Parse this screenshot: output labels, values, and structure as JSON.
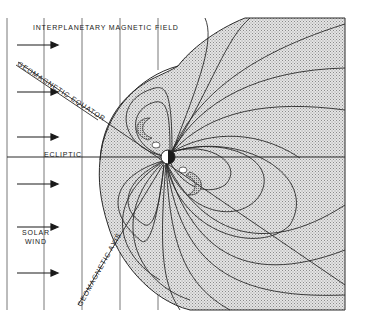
{
  "figure": {
    "labels": {
      "interplanetary_field": "INTERPLANETARY MAGNETIC FIELD",
      "geomagnetic_equator": "GEOMAGNETIC EQUATOR",
      "ecliptic": "ECLIPTIC",
      "solar_wind_line1": "SOLAR",
      "solar_wind_line2": "WIND",
      "geomagnetic_axis": "GEOMAGNETIC AXIS"
    },
    "colors": {
      "background": "#ffffff",
      "magnetosphere_fill": "#cfcfcf",
      "radiation_belt_fill": "#b8b8b8",
      "line": "#2a2a2a"
    },
    "solar_wind_arrows": 6,
    "imf_vertical_lines": 6
  }
}
